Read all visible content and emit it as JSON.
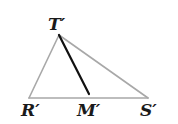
{
  "diagram": {
    "type": "triangle-with-median",
    "vertices": {
      "T": {
        "label": "T′",
        "x": 59,
        "y": 35
      },
      "R": {
        "label": "R′",
        "x": 29,
        "y": 98
      },
      "S": {
        "label": "S′",
        "x": 148,
        "y": 98
      },
      "M": {
        "label": "M′",
        "x": 89,
        "y": 98
      }
    },
    "segments": [
      {
        "from": "T",
        "to": "R",
        "color": "#a8a8a8",
        "width": 1.6
      },
      {
        "from": "T",
        "to": "S",
        "color": "#a8a8a8",
        "width": 1.6
      },
      {
        "from": "R",
        "to": "S",
        "color": "#a8a8a8",
        "width": 1.6
      },
      {
        "from": "T",
        "to": "M",
        "color": "#111111",
        "width": 2.2
      }
    ],
    "labels": {
      "T": "T′",
      "R": "R′",
      "M": "M′",
      "S": "S′"
    },
    "colors": {
      "triangle_edge": "#a8a8a8",
      "median": "#111111",
      "text": "#1a1a1a",
      "background": "#ffffff"
    }
  }
}
